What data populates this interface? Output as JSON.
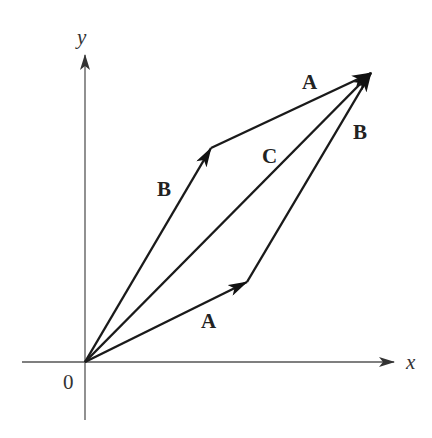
{
  "diagram": {
    "axes": {
      "x_label": "x",
      "y_label": "y",
      "origin_label": "0"
    },
    "vectors": [
      {
        "name": "A",
        "label": "A",
        "from": "origin",
        "to": "A-tip",
        "role": "lower A"
      },
      {
        "name": "B",
        "label": "B",
        "from": "A-tip",
        "to": "sum-tip",
        "role": "right B"
      },
      {
        "name": "B",
        "label": "B",
        "from": "origin",
        "to": "B-tip",
        "role": "left B"
      },
      {
        "name": "A",
        "label": "A",
        "from": "B-tip",
        "to": "sum-tip",
        "role": "upper A"
      },
      {
        "name": "C",
        "label": "C",
        "from": "origin",
        "to": "sum-tip",
        "role": "resultant C = A + B"
      }
    ],
    "colors": {
      "axis": "#555555",
      "vector": "#1a1a1a",
      "background": "#ffffff"
    }
  }
}
